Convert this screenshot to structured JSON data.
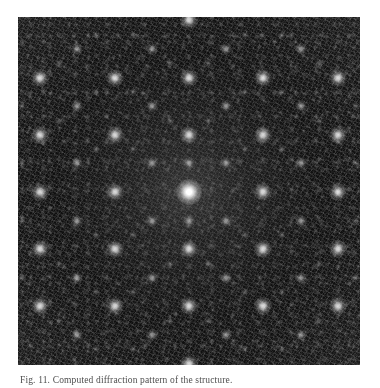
{
  "figure": {
    "kind": "diffraction-pattern",
    "panel": {
      "alt": "Electron diffraction pattern: dark speckled field with a bright central spot and a centered rectangular lattice of bright reflections",
      "background_color": "#101010",
      "spot_color": "#ffffff",
      "page_background": "#ffffff"
    },
    "caption": {
      "label": "Fig. 11",
      "text": "Fig. 11. Computed diffraction pattern of the structure."
    }
  },
  "chart_data": {
    "type": "scatter",
    "title": "Computed diffraction pattern",
    "xlabel": "",
    "ylabel": "",
    "grid": false,
    "legend": null,
    "xlim": [
      0,
      342
    ],
    "ylim": [
      0,
      348
    ],
    "units": "pixels",
    "lattice": {
      "description": "centered rectangular reciprocal lattice",
      "center_x": 171,
      "center_y": 175,
      "a_x": 37.2,
      "b_y": 28.6,
      "centering_offset_x": 18.6,
      "centering_offset_y": 14.3,
      "strong_order_x": 2,
      "strong_order_y": 2
    },
    "series": [
      {
        "name": "central beam",
        "points": [
          {
            "x": 171,
            "y": 175,
            "intensity": 1.0,
            "radius": 13
          }
        ]
      },
      {
        "name": "strong reflections",
        "intensity": 0.85,
        "radius": 9,
        "points": [
          {
            "x": 96.6,
            "y": 117.8
          },
          {
            "x": 171,
            "y": 117.8
          },
          {
            "x": 245.4,
            "y": 117.8
          },
          {
            "x": 22.2,
            "y": 117.8
          },
          {
            "x": 319.8,
            "y": 117.8
          },
          {
            "x": 96.6,
            "y": 175
          },
          {
            "x": 245.4,
            "y": 175
          },
          {
            "x": 22.2,
            "y": 175
          },
          {
            "x": 319.8,
            "y": 175
          },
          {
            "x": 96.6,
            "y": 232.2
          },
          {
            "x": 171,
            "y": 232.2
          },
          {
            "x": 245.4,
            "y": 232.2
          },
          {
            "x": 22.2,
            "y": 232.2
          },
          {
            "x": 319.8,
            "y": 232.2
          },
          {
            "x": 96.6,
            "y": 60.6
          },
          {
            "x": 171,
            "y": 60.6
          },
          {
            "x": 245.4,
            "y": 60.6
          },
          {
            "x": 22.2,
            "y": 60.6
          },
          {
            "x": 319.8,
            "y": 60.6
          },
          {
            "x": 96.6,
            "y": 289.4
          },
          {
            "x": 171,
            "y": 289.4
          },
          {
            "x": 245.4,
            "y": 289.4
          },
          {
            "x": 22.2,
            "y": 289.4
          },
          {
            "x": 319.8,
            "y": 289.4
          },
          {
            "x": 171,
            "y": 3.4
          },
          {
            "x": 171,
            "y": 346.6
          }
        ]
      },
      {
        "name": "medium reflections",
        "intensity": 0.55,
        "radius": 6,
        "points": [
          {
            "x": 133.8,
            "y": 146.4
          },
          {
            "x": 208.2,
            "y": 146.4
          },
          {
            "x": 133.8,
            "y": 203.6
          },
          {
            "x": 208.2,
            "y": 203.6
          },
          {
            "x": 59.4,
            "y": 146.4
          },
          {
            "x": 282.6,
            "y": 146.4
          },
          {
            "x": 59.4,
            "y": 203.6
          },
          {
            "x": 282.6,
            "y": 203.6
          },
          {
            "x": 133.8,
            "y": 89.2
          },
          {
            "x": 208.2,
            "y": 89.2
          },
          {
            "x": 133.8,
            "y": 260.8
          },
          {
            "x": 208.2,
            "y": 260.8
          },
          {
            "x": 59.4,
            "y": 89.2
          },
          {
            "x": 282.6,
            "y": 89.2
          },
          {
            "x": 59.4,
            "y": 260.8
          },
          {
            "x": 282.6,
            "y": 260.8
          },
          {
            "x": 133.8,
            "y": 32
          },
          {
            "x": 208.2,
            "y": 32
          },
          {
            "x": 133.8,
            "y": 318
          },
          {
            "x": 208.2,
            "y": 318
          },
          {
            "x": 59.4,
            "y": 32
          },
          {
            "x": 282.6,
            "y": 32
          },
          {
            "x": 59.4,
            "y": 318
          },
          {
            "x": 282.6,
            "y": 318
          },
          {
            "x": 171,
            "y": 146.4
          },
          {
            "x": 171,
            "y": 203.6
          }
        ]
      },
      {
        "name": "weak reflections",
        "intensity": 0.3,
        "radius": 4,
        "points": [
          {
            "x": 115.2,
            "y": 132.1
          },
          {
            "x": 226.8,
            "y": 132.1
          },
          {
            "x": 115.2,
            "y": 217.9
          },
          {
            "x": 226.8,
            "y": 217.9
          },
          {
            "x": 152.4,
            "y": 103.5
          },
          {
            "x": 189.6,
            "y": 103.5
          },
          {
            "x": 152.4,
            "y": 246.5
          },
          {
            "x": 189.6,
            "y": 246.5
          },
          {
            "x": 78,
            "y": 132.1
          },
          {
            "x": 264,
            "y": 132.1
          },
          {
            "x": 78,
            "y": 217.9
          },
          {
            "x": 264,
            "y": 217.9
          },
          {
            "x": 40.8,
            "y": 103.5
          },
          {
            "x": 301.2,
            "y": 103.5
          },
          {
            "x": 40.8,
            "y": 246.5
          },
          {
            "x": 301.2,
            "y": 246.5
          },
          {
            "x": 115.2,
            "y": 74.9
          },
          {
            "x": 226.8,
            "y": 74.9
          },
          {
            "x": 115.2,
            "y": 275.1
          },
          {
            "x": 226.8,
            "y": 275.1
          },
          {
            "x": 152.4,
            "y": 46.3
          },
          {
            "x": 189.6,
            "y": 46.3
          },
          {
            "x": 152.4,
            "y": 303.7
          },
          {
            "x": 189.6,
            "y": 303.7
          },
          {
            "x": 78,
            "y": 74.9
          },
          {
            "x": 264,
            "y": 74.9
          },
          {
            "x": 78,
            "y": 275.1
          },
          {
            "x": 264,
            "y": 275.1
          },
          {
            "x": 40.8,
            "y": 46.3
          },
          {
            "x": 301.2,
            "y": 46.3
          },
          {
            "x": 40.8,
            "y": 303.7
          },
          {
            "x": 301.2,
            "y": 303.7
          },
          {
            "x": 115.2,
            "y": 17.8
          },
          {
            "x": 226.8,
            "y": 17.8
          },
          {
            "x": 115.2,
            "y": 332.2
          },
          {
            "x": 226.8,
            "y": 332.2
          },
          {
            "x": 78,
            "y": 17.8
          },
          {
            "x": 264,
            "y": 17.8
          },
          {
            "x": 78,
            "y": 332.2
          },
          {
            "x": 264,
            "y": 332.2
          },
          {
            "x": 3.6,
            "y": 146.4
          },
          {
            "x": 338.4,
            "y": 146.4
          },
          {
            "x": 3.6,
            "y": 203.6
          },
          {
            "x": 338.4,
            "y": 203.6
          },
          {
            "x": 3.6,
            "y": 89.2
          },
          {
            "x": 338.4,
            "y": 89.2
          },
          {
            "x": 3.6,
            "y": 260.8
          },
          {
            "x": 338.4,
            "y": 260.8
          }
        ]
      }
    ]
  }
}
